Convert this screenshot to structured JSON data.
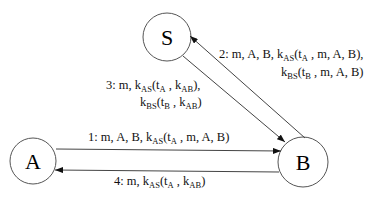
{
  "nodes": [
    {
      "id": "S",
      "label": "S",
      "cx": 167,
      "cy": 37,
      "r": 24
    },
    {
      "id": "A",
      "label": "A",
      "cx": 33,
      "cy": 161,
      "r": 23
    },
    {
      "id": "B",
      "label": "B",
      "cx": 303,
      "cy": 162,
      "r": 25
    }
  ],
  "edges": [
    {
      "from": "A",
      "to": "B",
      "label": "1: m, A, B, k_AS(t_A , m, A, B)"
    },
    {
      "from": "B",
      "to": "S",
      "label": "2: m, A, B, k_AS(t_A , m, A, B), k_BS(t_B , m, A, B)"
    },
    {
      "from": "S",
      "to": "B",
      "label": "3: m, k_AS(t_A , k_AB), k_BS(t_B , k_AB)"
    },
    {
      "from": "B",
      "to": "A",
      "label": "4: m, k_AS(t_A , k_AB)"
    }
  ],
  "msg1": {
    "pre": "1: m, A, B, k",
    "sub1": "AS",
    "mid": "(t",
    "sub2": "A",
    "post": " , m, A, B)"
  },
  "msg2": {
    "line1": {
      "pre": "2: m, A, B, k",
      "sub1": "AS",
      "mid": "(t",
      "sub2": "A",
      "post": " , m, A, B),"
    },
    "line2": {
      "pre": "k",
      "sub1": "BS",
      "mid": "(t",
      "sub2": "B",
      "post": " , m, A, B)"
    }
  },
  "msg3": {
    "line1": {
      "pre": "3: m, k",
      "sub1": "AS",
      "mid": "(t",
      "sub2": "A",
      "mid2": " , k",
      "sub3": "AB",
      "post": "),"
    },
    "line2": {
      "pre": "k",
      "sub1": "BS",
      "mid": "(t",
      "sub2": "B",
      "mid2": " , k",
      "sub3": "AB",
      "post": ")"
    }
  },
  "msg4": {
    "pre": "4: m, k",
    "sub1": "AS",
    "mid": "(t",
    "sub2": "A",
    "mid2": " , k",
    "sub3": "AB",
    "post": ")"
  }
}
